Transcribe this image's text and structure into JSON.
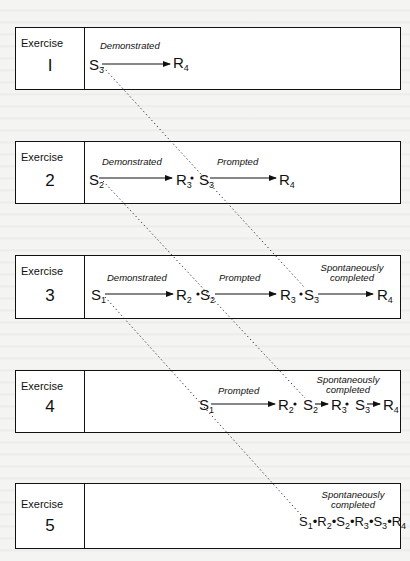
{
  "diagram": {
    "exercises": [
      {
        "title": "Exercise",
        "number": "I",
        "annotations": {
          "demonstrated": "Demonstrated"
        },
        "chain": [
          "S3",
          "R4"
        ]
      },
      {
        "title": "Exercise",
        "number": "2",
        "annotations": {
          "demonstrated": "Demonstrated",
          "prompted": "Prompted"
        },
        "chain": [
          "S2",
          "R3",
          "S3",
          "R4"
        ]
      },
      {
        "title": "Exercise",
        "number": "3",
        "annotations": {
          "demonstrated": "Demonstrated",
          "prompted": "Prompted",
          "spontaneous_1": "Spontaneously",
          "spontaneous_2": "completed"
        },
        "chain": [
          "S1",
          "R2",
          "S2",
          "R3",
          "S3",
          "R4"
        ]
      },
      {
        "title": "Exercise",
        "number": "4",
        "annotations": {
          "prompted": "Prompted",
          "spontaneous_1": "Spontaneously",
          "spontaneous_2": "completed"
        },
        "chain": [
          "S1",
          "R2",
          "S2",
          "R3",
          "S3",
          "R4"
        ]
      },
      {
        "title": "Exercise",
        "number": "5",
        "annotations": {
          "spontaneous_1": "Spontaneously",
          "spontaneous_2": "completed"
        },
        "chain": [
          "S1",
          "R2",
          "S2",
          "R3",
          "S3",
          "R4"
        ]
      }
    ],
    "symbols": {
      "S": "S",
      "R": "R",
      "sub1": "1",
      "sub2": "2",
      "sub3": "3",
      "sub4": "4"
    }
  }
}
